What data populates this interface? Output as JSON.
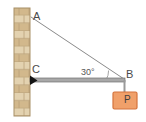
{
  "figure": {
    "name": "cantilever-beam-with-cable-diagram",
    "type": "statics-free-body-diagram",
    "background_color": "#ffffff",
    "width": 146,
    "height": 122
  },
  "wall": {
    "name": "brick-wall",
    "x": 14,
    "y": 8,
    "width": 16,
    "height": 108,
    "brick_fill": "#d3bb92",
    "brick_light": "#e6d6b6",
    "mortar_color": "#b79f77",
    "outline_color": "#a88f67",
    "rows": 14
  },
  "members": {
    "cable": {
      "name": "cable-A-B",
      "color": "#8a8a8a",
      "width": 1,
      "from": {
        "x": 31,
        "y": 17
      },
      "to": {
        "x": 124,
        "y": 79
      }
    },
    "beam": {
      "name": "beam-C-B",
      "color": "#a0a0a0",
      "edge_color": "#777777",
      "thickness": 4,
      "from": {
        "x": 30,
        "y": 80
      },
      "to": {
        "x": 124,
        "y": 80
      }
    },
    "hanger": {
      "name": "hanger-rod-B-P",
      "color": "#9a9a9a",
      "width": 2,
      "from": {
        "x": 124,
        "y": 80
      },
      "to": {
        "x": 124,
        "y": 92
      }
    }
  },
  "support": {
    "name": "pin-support-at-C",
    "color": "#1a1a1a",
    "x": 30,
    "y": 80,
    "size": 7
  },
  "load_block": {
    "name": "load-block-P",
    "fill": "#f0a06a",
    "stroke": "#d4733c",
    "x": 113,
    "y": 92,
    "width": 24,
    "height": 17
  },
  "angle_arc": {
    "name": "angle-arc-at-B",
    "color": "#8a8a8a",
    "vertex": {
      "x": 124,
      "y": 80
    },
    "radius": 24,
    "start_deg": 0,
    "end_deg": 30
  },
  "labels": {
    "point_a": "A",
    "point_b": "B",
    "point_c": "C",
    "angle": "30°",
    "load": "P"
  }
}
